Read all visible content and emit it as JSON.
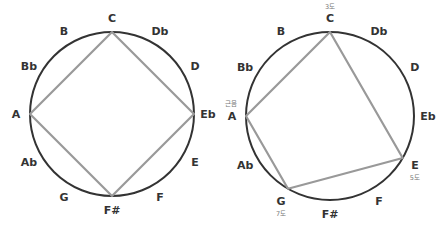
{
  "diagrams": [
    {
      "name": "diminished-seventh-circle",
      "notes": [
        "C",
        "Db",
        "D",
        "Eb",
        "E",
        "F",
        "F#",
        "G",
        "Ab",
        "A",
        "Bb",
        "B"
      ],
      "polygon_notes": [
        "C",
        "Eb",
        "F#",
        "A"
      ],
      "annotations": []
    },
    {
      "name": "minor-seventh-circle",
      "notes": [
        "C",
        "Db",
        "D",
        "Eb",
        "E",
        "F",
        "F#",
        "G",
        "Ab",
        "A",
        "Bb",
        "B"
      ],
      "polygon_notes": [
        "C",
        "E",
        "G",
        "A"
      ],
      "annotations": [
        {
          "note": "A",
          "text": "근음"
        },
        {
          "note": "C",
          "text": "3도"
        },
        {
          "note": "E",
          "text": "5도"
        },
        {
          "note": "G",
          "text": "7도"
        }
      ]
    }
  ],
  "colors": {
    "circle": "#333333",
    "polygon": "#999999",
    "label": "#333333",
    "annotation": "#777777"
  }
}
